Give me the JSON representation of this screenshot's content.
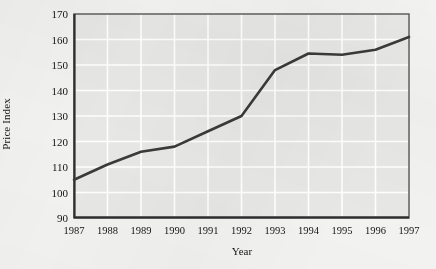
{
  "chart_data": {
    "type": "line",
    "title": "",
    "xlabel": "Year",
    "ylabel": "Price Index",
    "categories": [
      "1987",
      "1988",
      "1989",
      "1990",
      "1991",
      "1992",
      "1993",
      "1994",
      "1995",
      "1996",
      "1997"
    ],
    "x": [
      1987,
      1988,
      1989,
      1990,
      1991,
      1992,
      1993,
      1994,
      1995,
      1996,
      1997
    ],
    "values": [
      105,
      111,
      116,
      118,
      124,
      130,
      148,
      154.5,
      154,
      156,
      161
    ],
    "series": [
      {
        "name": "Price Index",
        "values": [
          105,
          111,
          116,
          118,
          124,
          130,
          148,
          154.5,
          154,
          156,
          161
        ]
      }
    ],
    "xlim": [
      1987,
      1997
    ],
    "ylim": [
      90,
      170
    ],
    "yticks": [
      90,
      100,
      110,
      120,
      130,
      140,
      150,
      160,
      170
    ],
    "ytick_labels": [
      "90",
      "100",
      "110",
      "120",
      "130",
      "140",
      "150",
      "160",
      "170"
    ],
    "xticks": [
      1987,
      1988,
      1989,
      1990,
      1991,
      1992,
      1993,
      1994,
      1995,
      1996,
      1997
    ],
    "xtick_labels": [
      "1987",
      "1988",
      "1989",
      "1990",
      "1991",
      "1992",
      "1993",
      "1994",
      "1995",
      "1996",
      "1997"
    ],
    "grid": true,
    "grid_color": "#ffffff",
    "legend": "none",
    "plot_background": "#e7e7e5",
    "figure_background": "#f2f2f0",
    "line_color": "#3a3a3a",
    "axis_color": "#4a4a4a"
  }
}
